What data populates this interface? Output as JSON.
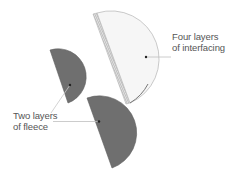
{
  "diagram": {
    "type": "illustration",
    "colors": {
      "fleece": "#6f6f6f",
      "fleece_edge": "#5e5e5e",
      "interfacing": "#f6f6f6",
      "interfacing_edge": "#bdbdbd",
      "leader_line": "#bfbfbf",
      "label_text": "#555555"
    },
    "pieces": [
      {
        "id": "interfacing-piece",
        "material": "interfacing",
        "layers": 4
      },
      {
        "id": "fleece-piece-small",
        "material": "fleece",
        "layers": 2
      },
      {
        "id": "fleece-piece-large",
        "material": "fleece",
        "layers": 2
      }
    ],
    "labels": {
      "interfacing": {
        "line1": "Four layers",
        "line2": "of interfacing"
      },
      "fleece": {
        "line1": "Two layers",
        "line2": "of fleece"
      }
    }
  }
}
